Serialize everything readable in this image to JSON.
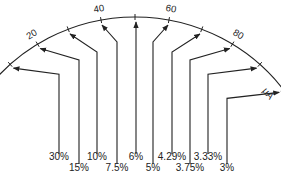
{
  "diagram": {
    "type": "meter-scale-error-diagram",
    "unit": "μA",
    "scale": {
      "min": 0,
      "max": 100,
      "major_ticks": [
        {
          "value": 0,
          "label": "0"
        },
        {
          "value": 20,
          "label": "20"
        },
        {
          "value": 40,
          "label": "40"
        },
        {
          "value": 60,
          "label": "60"
        },
        {
          "value": 80,
          "label": "80"
        },
        {
          "value": 100,
          "label": "100"
        }
      ],
      "minor_ticks": [
        10,
        30,
        50,
        70,
        90
      ]
    },
    "pointers": [
      {
        "value": 10,
        "label": "30%"
      },
      {
        "value": 20,
        "label": "15%"
      },
      {
        "value": 30,
        "label": "10%"
      },
      {
        "value": 40,
        "label": "7.5%"
      },
      {
        "value": 50,
        "label": "6%"
      },
      {
        "value": 60,
        "label": "5%"
      },
      {
        "value": 70,
        "label": "4.29%"
      },
      {
        "value": 80,
        "label": "3.75%"
      },
      {
        "value": 90,
        "label": "3.33%"
      },
      {
        "value": 100,
        "label": "3%"
      }
    ],
    "colors": {
      "ink": "#222222",
      "background": "#ffffff"
    }
  }
}
